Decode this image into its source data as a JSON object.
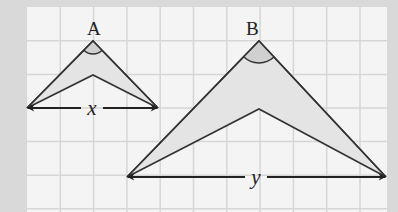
{
  "diagram": {
    "background_color": "#d9d9d9",
    "panel_color": "#f4f4f4",
    "grid_color": "#d6d6d6",
    "line_color": "#333333",
    "fill_color": "#e4e4e4",
    "angle_fill_color": "#d0d0d0",
    "panel": {
      "x": 27,
      "y": 7,
      "width": 360,
      "height": 210
    },
    "grid_spacing": 33.3,
    "figures": [
      {
        "label": "A",
        "apex": [
          93,
          41
        ],
        "inner_vertex": [
          93,
          75
        ],
        "base_left": [
          27,
          108
        ],
        "base_right": [
          158,
          108
        ],
        "angle_radius": 13,
        "dimension_label": "x",
        "label_pos": [
          87,
          35
        ],
        "dimension_label_pos": [
          92,
          115
        ]
      },
      {
        "label": "B",
        "apex": [
          259,
          41
        ],
        "inner_vertex": [
          259,
          109
        ],
        "base_left": [
          127,
          177
        ],
        "base_right": [
          386,
          177
        ],
        "angle_radius": 22,
        "dimension_label": "y",
        "label_pos": [
          246,
          35
        ],
        "dimension_label_pos": [
          256,
          184
        ]
      }
    ]
  }
}
